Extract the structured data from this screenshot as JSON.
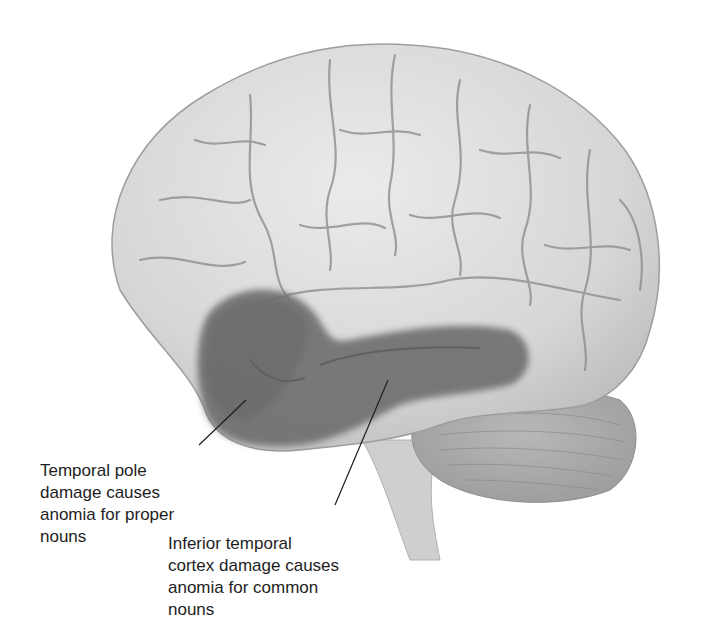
{
  "figure": {
    "type": "brain-lateral-view",
    "colors": {
      "background": "#ffffff",
      "cortex": "#dcdcdc",
      "cortex_shadow": "#b4b4b4",
      "sulcus": "#8e8e8e",
      "highlight_region": "#6e6e6e",
      "cerebellum": "#a8a8a8",
      "brainstem": "#cfcfcf",
      "text": "#1e1e1e",
      "leader_line": "#1e1e1e"
    },
    "annotations": [
      {
        "id": "temporal-pole",
        "text": "Temporal pole\ndamage causes\nanomia for proper\nnouns"
      },
      {
        "id": "inferior-temporal",
        "text": "Inferior temporal\ncortex damage causes\nanomia for common\nnouns"
      }
    ]
  }
}
